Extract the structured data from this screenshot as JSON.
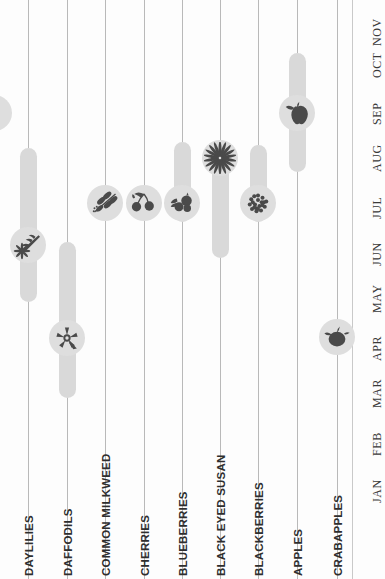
{
  "colors": {
    "background": "#fdfdfd",
    "gridline": "#b9b9b9",
    "bar": "#d9d9d9",
    "node": "#dedede",
    "icon": "#4a4a4a",
    "label_text": "#2e2e2e",
    "month_text": "#3a3a3a"
  },
  "chart_data": {
    "type": "bar",
    "title": "",
    "subtitle": "",
    "xlabel": "",
    "ylabel": "",
    "orientation": "vertical-gantt",
    "grid": true,
    "legend": null,
    "axis_months": [
      "JAN",
      "FEB",
      "MAR",
      "APR",
      "MAY",
      "JUN",
      "JUL",
      "AUG",
      "SEP",
      "OCT",
      "NOV"
    ],
    "month_positions_px": [
      487,
      440,
      392,
      345,
      297,
      250,
      203,
      156,
      109,
      62,
      30
    ],
    "categories": [
      "DAYLILIES",
      "DAFFODILS",
      "COMMON MILKWEED",
      "CHERRIES",
      "BLUEBERRIES",
      "BLACK EYED SUSAN",
      "BLACKBERRIES",
      "APPLES",
      "CRABAPPLES"
    ],
    "series": [
      {
        "name": "DAYLILIES",
        "icon": "daylily-flower-icon",
        "start_month": "JUN",
        "end_month": "AUG",
        "peak_month": "JUL",
        "x_px": 28,
        "bar_top_px": 148,
        "bar_bottom_px": 302,
        "node_center_px": 245,
        "has_bar": true
      },
      {
        "name": "DAFFODILS",
        "icon": "daffodil-flower-icon",
        "start_month": "MAR",
        "end_month": "JUN",
        "peak_month": "APR",
        "x_px": 67,
        "bar_top_px": 242,
        "bar_bottom_px": 398,
        "node_center_px": 338,
        "has_bar": true
      },
      {
        "name": "COMMON MILKWEED",
        "icon": "milkweed-leaf-icon",
        "start_month": "JUL",
        "end_month": "JUL",
        "peak_month": "JUL",
        "x_px": 105,
        "bar_top_px": 203,
        "bar_bottom_px": 203,
        "node_center_px": 203,
        "has_bar": false
      },
      {
        "name": "CHERRIES",
        "icon": "cherries-icon",
        "start_month": "JUL",
        "end_month": "JUL",
        "peak_month": "JUL",
        "x_px": 144,
        "bar_top_px": 203,
        "bar_bottom_px": 203,
        "node_center_px": 203,
        "has_bar": false
      },
      {
        "name": "BLUEBERRIES",
        "icon": "blueberries-icon",
        "start_month": "JUL",
        "end_month": "AUG",
        "peak_month": "JUL",
        "x_px": 182,
        "bar_top_px": 142,
        "bar_bottom_px": 222,
        "node_center_px": 203,
        "has_bar": true
      },
      {
        "name": "BLACK EYED SUSAN",
        "icon": "black-eyed-susan-flower-icon",
        "start_month": "JUN",
        "end_month": "AUG",
        "peak_month": "AUG",
        "x_px": 220,
        "bar_top_px": 160,
        "bar_bottom_px": 258,
        "node_center_px": 158,
        "has_bar": true
      },
      {
        "name": "BLACKBERRIES",
        "icon": "blackberry-icon",
        "start_month": "JUL",
        "end_month": "AUG",
        "peak_month": "JUL",
        "x_px": 258,
        "bar_top_px": 145,
        "bar_bottom_px": 222,
        "node_center_px": 203,
        "has_bar": true
      },
      {
        "name": "APPLES",
        "icon": "apple-icon",
        "start_month": "AUG",
        "end_month": "OCT",
        "peak_month": "SEP",
        "x_px": 297,
        "bar_top_px": 53,
        "bar_bottom_px": 172,
        "node_center_px": 113,
        "has_bar": true
      },
      {
        "name": "CRABAPPLES",
        "icon": "crabapple-icon",
        "start_month": "APR",
        "end_month": "APR",
        "peak_month": "APR",
        "x_px": 337,
        "bar_top_px": 337,
        "bar_bottom_px": 337,
        "node_center_px": 337,
        "has_bar": false
      }
    ],
    "partial_left_edge_node": {
      "name": "partial-offscreen-node",
      "x_px": -6,
      "node_center_px": 113
    }
  }
}
